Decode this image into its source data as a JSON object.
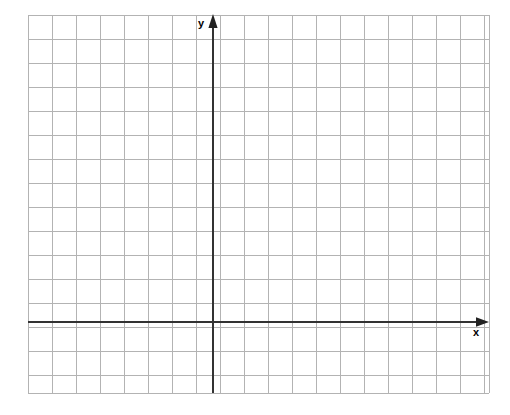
{
  "figure": {
    "title": "",
    "type": "coordinate-grid",
    "background_color": "#ffffff"
  },
  "labels": {
    "y_axis": "y",
    "x_axis": "x"
  },
  "chart_data": {
    "type": "scatter",
    "title": "",
    "subtitle": "",
    "xlabel": "x",
    "ylabel": "y",
    "series": [
      {
        "name": "",
        "x": [],
        "y": []
      }
    ],
    "annotations": [],
    "legend": {
      "entries": [],
      "position": "none"
    },
    "grid": {
      "enabled": true,
      "minor": false,
      "cell_size_px": 24,
      "columns": 19,
      "rows": 16,
      "color": "#b3b3b3",
      "line_width_px": 1
    },
    "axes": {
      "x": {
        "visible": true,
        "color": "#333333",
        "line_width_px": 2,
        "arrow": "right",
        "tick_labels": [],
        "range_cells": [
          -7.7,
          11.5
        ],
        "origin_px": 322
      },
      "y": {
        "visible": true,
        "color": "#333333",
        "line_width_px": 2,
        "arrow": "up",
        "tick_labels": [],
        "range_cells": [
          -2.9,
          12.8
        ],
        "origin_px": 213
      }
    },
    "plot_area_px": {
      "left": 28,
      "top": 15,
      "right": 489,
      "bottom": 393
    },
    "origin_px": {
      "x": 213,
      "y": 322
    },
    "data_points": [],
    "values": [],
    "categories": []
  }
}
